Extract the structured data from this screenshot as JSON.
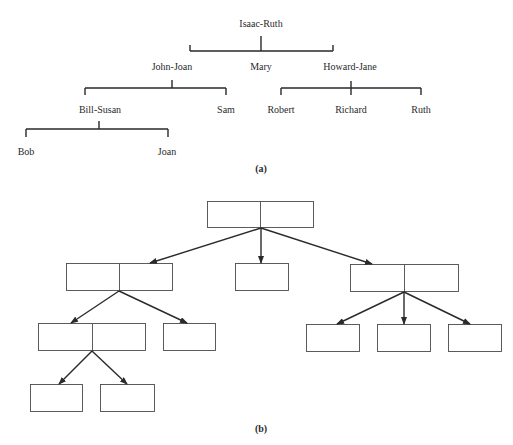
{
  "diagram_a": {
    "caption": "(a)",
    "root": "Isaac-Ruth",
    "level1": [
      "John-Joan",
      "Mary",
      "Howard-Jane"
    ],
    "john_joan_children": [
      "Bill-Susan",
      "Sam"
    ],
    "howard_jane_children": [
      "Robert",
      "Richard",
      "Ruth"
    ],
    "bill_susan_children": [
      "Bob",
      "Joan"
    ]
  },
  "diagram_b": {
    "caption": "(b)",
    "description": "Linked-node representation of family tree: couple nodes are two-cell boxes, single persons are one-cell boxes, arrows point from parents to children"
  }
}
